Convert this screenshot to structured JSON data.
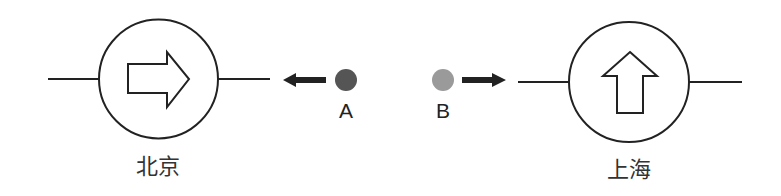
{
  "stations": [
    {
      "name": "北京",
      "arrow_direction": "right"
    },
    {
      "name": "上海",
      "arrow_direction": "up"
    }
  ],
  "points": [
    {
      "label": "A",
      "color": "#555555",
      "arrow_direction": "left"
    },
    {
      "label": "B",
      "color": "#9a9a9a",
      "arrow_direction": "right"
    }
  ],
  "colors": {
    "line": "#222222",
    "arrow_fill": "#222222"
  }
}
